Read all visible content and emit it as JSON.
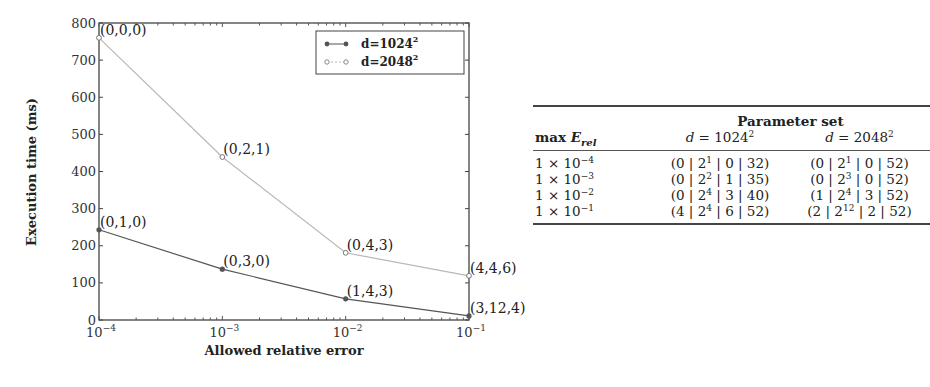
{
  "chart_data": {
    "type": "line",
    "title": "",
    "xlabel": "Allowed relative error",
    "ylabel": "Execution time (ms)",
    "xscale": "log",
    "xlim": [
      0.0001,
      0.1
    ],
    "ylim": [
      0,
      800
    ],
    "grid": false,
    "legend_position": "upper right",
    "x": [
      0.0001,
      0.001,
      0.01,
      0.1
    ],
    "x_tick_labels": [
      "10^-4",
      "10^-3",
      "10^-2",
      "10^-1"
    ],
    "y_ticks": [
      0,
      100,
      200,
      300,
      400,
      500,
      600,
      700,
      800
    ],
    "series": [
      {
        "name": "d=1024^2",
        "legend_label": "d=1024",
        "legend_sup": "2",
        "color": "#555555",
        "marker": "filled-circle",
        "values": [
          243,
          137,
          57,
          11
        ],
        "point_labels": [
          "(0,1,0)",
          "(0,3,0)",
          "(1,4,3)",
          "(3,12,4)"
        ]
      },
      {
        "name": "d=2048^2",
        "legend_label": "d=2048",
        "legend_sup": "2",
        "color": "#b8b8b8",
        "marker": "open-circle",
        "values": [
          760,
          439,
          181,
          119
        ],
        "point_labels": [
          "(0,0,0)",
          "(0,2,1)",
          "(0,4,3)",
          "(4,4,6)"
        ]
      }
    ]
  },
  "table": {
    "group_header": "Parameter set",
    "col0_header_main": "max ",
    "col0_header_var": "E",
    "col0_header_sub": "rel",
    "col1_header_var": "d",
    "col1_header_eq": " = 1024",
    "col1_header_sup": "2",
    "col2_header_var": "d",
    "col2_header_eq": " = 2048",
    "col2_header_sup": "2",
    "rows": [
      {
        "err_base": "1 × 10",
        "err_exp": "−4",
        "a1": "(0 | 2",
        "a1_sup": "1",
        "a2": " | 0 | 32)",
        "b1": "(0 | 2",
        "b1_sup": "1",
        "b2": " | 0 | 52)"
      },
      {
        "err_base": "1 × 10",
        "err_exp": "−3",
        "a1": "(0 | 2",
        "a1_sup": "2",
        "a2": " | 1 | 35)",
        "b1": "(0 | 2",
        "b1_sup": "3",
        "b2": " | 0 | 52)"
      },
      {
        "err_base": "1 × 10",
        "err_exp": "−2",
        "a1": "(0 | 2",
        "a1_sup": "4",
        "a2": " | 3 | 40)",
        "b1": "(1 | 2",
        "b1_sup": "4",
        "b2": " | 3 | 52)"
      },
      {
        "err_base": "1 × 10",
        "err_exp": "−1",
        "a1": "(4 | 2",
        "a1_sup": "4",
        "a2": " | 6 | 52)",
        "b1": "(2 | 2",
        "b1_sup": "12",
        "b2": " | 2 | 52)"
      }
    ]
  }
}
